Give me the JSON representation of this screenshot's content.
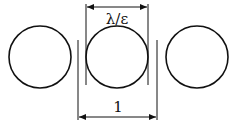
{
  "diagram": {
    "labels": {
      "top_dimension": "λ/ε",
      "bottom_dimension": "1"
    },
    "colors": {
      "stroke": "#111111",
      "background": "#ffffff"
    },
    "circles": [
      {
        "name": "left-circle",
        "cx": 40,
        "cy": 57,
        "r": 31
      },
      {
        "name": "middle-circle",
        "cx": 117,
        "cy": 57,
        "r": 31
      },
      {
        "name": "right-circle",
        "cx": 197,
        "cy": 57,
        "r": 31
      }
    ]
  }
}
